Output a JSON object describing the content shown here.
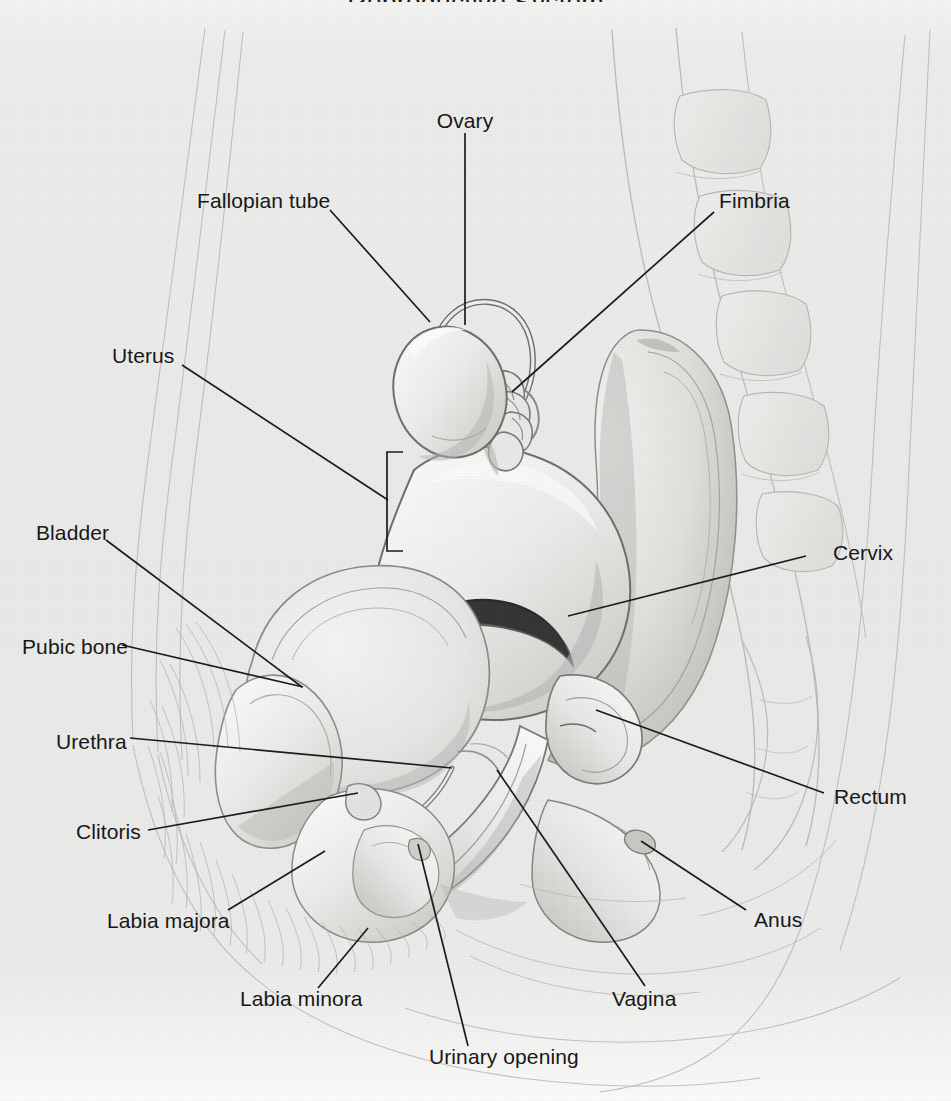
{
  "figure": {
    "kind": "anatomical-illustration",
    "cropped_heading": "Reproductive System",
    "background_color": "#eaeae9",
    "line_color": "#1c1c1c",
    "text_color": "#181818",
    "drawing_tone": "#9a9a98"
  },
  "labels": [
    {
      "id": "ovary",
      "text": "Ovary",
      "x": 465,
      "y": 122,
      "align": "c"
    },
    {
      "id": "fallopian-tube",
      "text": "Fallopian tube",
      "x": 197,
      "y": 202,
      "align": "l"
    },
    {
      "id": "fimbria",
      "text": "Fimbria",
      "x": 719,
      "y": 202,
      "align": "l"
    },
    {
      "id": "uterus",
      "text": "Uterus",
      "x": 112,
      "y": 357,
      "align": "l"
    },
    {
      "id": "bladder",
      "text": "Bladder",
      "x": 36,
      "y": 534,
      "align": "l"
    },
    {
      "id": "cervix",
      "text": "Cervix",
      "x": 833,
      "y": 554,
      "align": "l"
    },
    {
      "id": "pubic-bone",
      "text": "Pubic bone",
      "x": 22,
      "y": 648,
      "align": "l"
    },
    {
      "id": "urethra",
      "text": "Urethra",
      "x": 56,
      "y": 743,
      "align": "l"
    },
    {
      "id": "rectum",
      "text": "Rectum",
      "x": 834,
      "y": 798,
      "align": "l"
    },
    {
      "id": "clitoris",
      "text": "Clitoris",
      "x": 76,
      "y": 833,
      "align": "l"
    },
    {
      "id": "labia-majora",
      "text": "Labia majora",
      "x": 107,
      "y": 922,
      "align": "l"
    },
    {
      "id": "anus",
      "text": "Anus",
      "x": 754,
      "y": 921,
      "align": "l"
    },
    {
      "id": "labia-minora",
      "text": "Labia minora",
      "x": 240,
      "y": 1000,
      "align": "l"
    },
    {
      "id": "vagina",
      "text": "Vagina",
      "x": 612,
      "y": 1000,
      "align": "l"
    },
    {
      "id": "urinary-opening",
      "text": "Urinary opening",
      "x": 429,
      "y": 1058,
      "align": "l"
    }
  ],
  "leaders": [
    {
      "id": "ovary",
      "points": "465,133 465,325"
    },
    {
      "id": "fallopian-tube",
      "points": "330,210 430,322"
    },
    {
      "id": "fimbria",
      "points": "714,212 512,392"
    },
    {
      "id": "uterus",
      "points": "182,365 388,500"
    },
    {
      "id": "bladder",
      "points": "106,540 302,687"
    },
    {
      "id": "cervix",
      "points": "806,556 568,616"
    },
    {
      "id": "pubic-bone",
      "points": "122,645 303,687"
    },
    {
      "id": "urethra",
      "points": "130,738 452,768"
    },
    {
      "id": "rectum",
      "points": "824,793 596,710"
    },
    {
      "id": "clitoris",
      "points": "148,830 358,793"
    },
    {
      "id": "labia-majora",
      "points": "228,910 325,851"
    },
    {
      "id": "anus",
      "points": "746,910 641,841"
    },
    {
      "id": "labia-minora",
      "points": "318,988 368,928"
    },
    {
      "id": "vagina",
      "points": "645,986 497,770"
    },
    {
      "id": "urinary-opening",
      "points": "468,1046 418,844"
    }
  ],
  "bracket": {
    "id": "uterus-bracket",
    "x": 387,
    "y_top": 452,
    "y_bottom": 551,
    "depth": 16
  },
  "organs": [
    {
      "id": "ovary",
      "name": "Ovary"
    },
    {
      "id": "fallopian-tube",
      "name": "Fallopian tube"
    },
    {
      "id": "fimbria",
      "name": "Fimbria"
    },
    {
      "id": "uterus",
      "name": "Uterus"
    },
    {
      "id": "cervix",
      "name": "Cervix"
    },
    {
      "id": "vagina",
      "name": "Vagina"
    },
    {
      "id": "bladder",
      "name": "Bladder"
    },
    {
      "id": "urethra",
      "name": "Urethra"
    },
    {
      "id": "pubic-bone",
      "name": "Pubic bone"
    },
    {
      "id": "rectum",
      "name": "Rectum"
    },
    {
      "id": "anus",
      "name": "Anus"
    },
    {
      "id": "clitoris",
      "name": "Clitoris"
    },
    {
      "id": "labia-majora",
      "name": "Labia majora"
    },
    {
      "id": "labia-minora",
      "name": "Labia minora"
    },
    {
      "id": "urinary-opening",
      "name": "Urinary opening"
    },
    {
      "id": "spine",
      "name": "Sacrum and vertebrae"
    }
  ]
}
